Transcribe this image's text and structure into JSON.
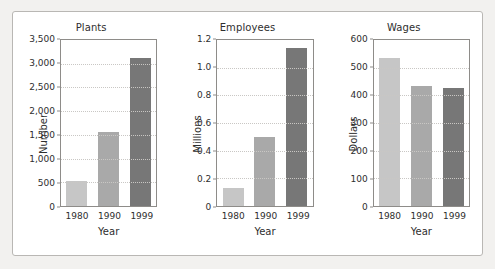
{
  "figure": {
    "background_color": "#f2f1ef",
    "panel_color": "#ffffff",
    "border_color": "#b9b7b4"
  },
  "series_colors": {
    "1980": "#c6c6c6",
    "1990": "#a9a9a9",
    "1999": "#777777"
  },
  "chart_data": [
    {
      "type": "bar",
      "title": "Plants",
      "xlabel": "Year",
      "ylabel": "Number",
      "categories": [
        "1980",
        "1990",
        "1999"
      ],
      "values": [
        530,
        1570,
        3120
      ],
      "ylim": [
        0,
        3500
      ],
      "yticks": [
        0,
        500,
        1000,
        1500,
        2000,
        2500,
        3000,
        3500
      ],
      "ytick_labels": [
        "0",
        "500",
        "1,000",
        "1,500",
        "2,000",
        "2,500",
        "3,000",
        "3,500"
      ],
      "grid": true,
      "legend": "none"
    },
    {
      "type": "bar",
      "title": "Employees",
      "xlabel": "Year",
      "ylabel": "Millions",
      "categories": [
        "1980",
        "1990",
        "1999"
      ],
      "values": [
        0.13,
        0.5,
        1.14
      ],
      "ylim": [
        0,
        1.2
      ],
      "yticks": [
        0,
        0.2,
        0.4,
        0.6,
        0.8,
        1.0,
        1.2
      ],
      "ytick_labels": [
        "0",
        "0.2",
        "0.4",
        "0.6",
        "0.8",
        "1.0",
        "1.2"
      ],
      "grid": true,
      "legend": "none"
    },
    {
      "type": "bar",
      "title": "Wages",
      "xlabel": "Year",
      "ylabel": "Dollars",
      "categories": [
        "1980",
        "1990",
        "1999"
      ],
      "values": [
        535,
        435,
        428
      ],
      "ylim": [
        0,
        600
      ],
      "yticks": [
        0,
        100,
        200,
        300,
        400,
        500,
        600
      ],
      "ytick_labels": [
        "0",
        "100",
        "200",
        "300",
        "400",
        "500",
        "600"
      ],
      "grid": true,
      "legend": "none"
    }
  ]
}
